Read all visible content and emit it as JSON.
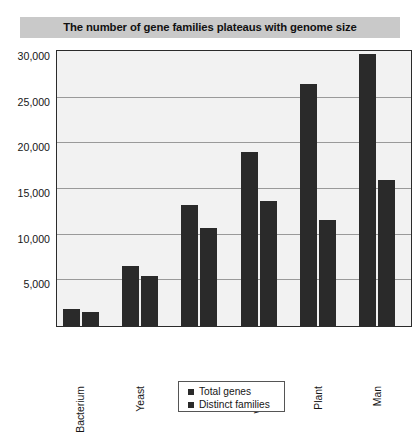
{
  "title": "The number of gene families plateaus with genome size",
  "colors": {
    "title_band": "#c9c9c9",
    "bar": "#2a2a2a",
    "plot_background": "#f2f2f2",
    "gridline": "#9a9a9a",
    "axis": "#2b2b2b"
  },
  "axis": {
    "y_ticks": [
      "5,000",
      "10,000",
      "15,000",
      "20,000",
      "25,000",
      "30,000"
    ],
    "x_ticks": [
      "Bacterium",
      "Yeast",
      "Fly",
      "Worm",
      "Plant",
      "Man"
    ]
  },
  "legend": {
    "items": [
      {
        "label": "Total genes",
        "swatch": "legend-swatch-total-genes"
      },
      {
        "label": "Distinct families",
        "swatch": "legend-swatch-distinct-families"
      }
    ]
  },
  "chart_data": {
    "type": "bar",
    "title": "The number of gene families plateaus with genome size",
    "xlabel": "",
    "ylabel": "",
    "ylim": [
      0,
      30000
    ],
    "ytick_values": [
      5000,
      10000,
      15000,
      20000,
      25000,
      30000
    ],
    "grid": true,
    "legend_position": "bottom-center",
    "categories": [
      "Bacterium",
      "Yeast",
      "Fly",
      "Worm",
      "Plant",
      "Man"
    ],
    "series": [
      {
        "name": "Total genes",
        "values": [
          1900,
          6600,
          13200,
          19000,
          26500,
          29800
        ]
      },
      {
        "name": "Distinct families",
        "values": [
          1500,
          5500,
          10700,
          13700,
          11600,
          16000
        ]
      }
    ]
  }
}
